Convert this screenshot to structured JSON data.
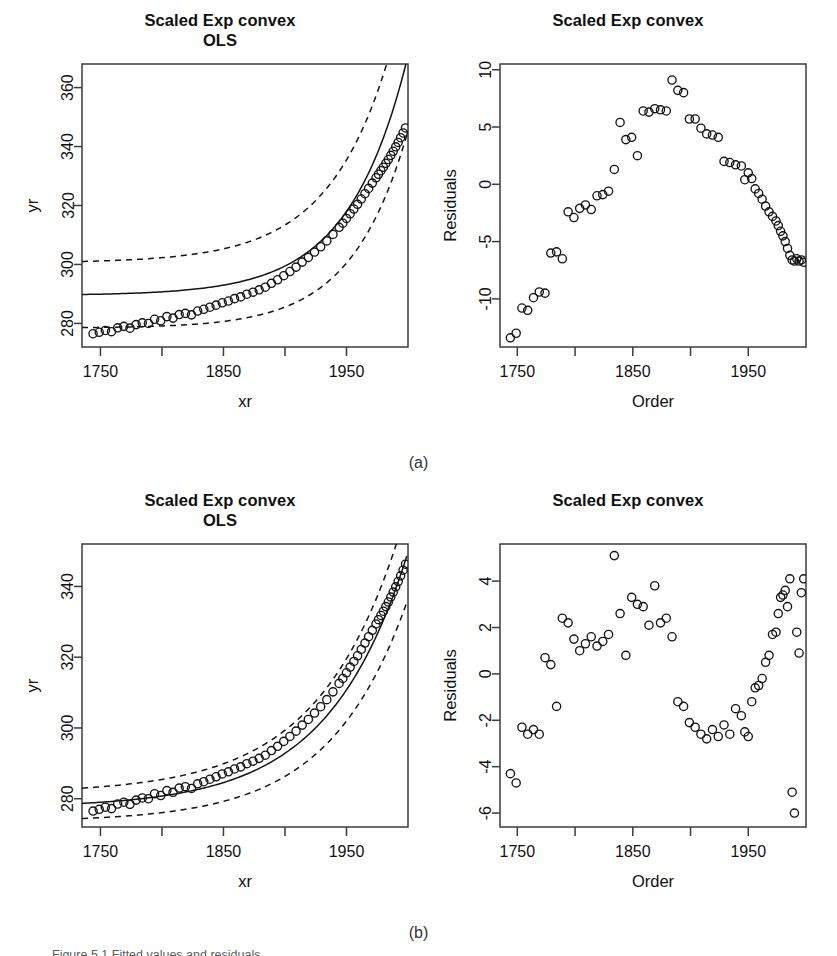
{
  "figure": {
    "panel_a_label": "(a)",
    "panel_b_label": "(b)",
    "caption": "Figure 5.1 Fitted values and residuals"
  },
  "panels": {
    "a_left": {
      "title_line1": "Scaled Exp convex",
      "title_line2": "OLS",
      "xlabel": "xr",
      "ylabel": "yr"
    },
    "a_right": {
      "title_line1": "Scaled Exp convex",
      "title_line2": "",
      "xlabel": "Order",
      "ylabel": "Residuals"
    },
    "b_left": {
      "title_line1": "Scaled Exp convex",
      "title_line2": "OLS",
      "xlabel": "xr",
      "ylabel": "yr"
    },
    "b_right": {
      "title_line1": "Scaled Exp convex",
      "title_line2": "",
      "xlabel": "Order",
      "ylabel": "Residuals"
    }
  },
  "chart_data": [
    {
      "id": "a_left",
      "type": "scatter",
      "title": "Scaled Exp convex OLS",
      "xlabel": "xr",
      "ylabel": "yr",
      "xlim": [
        1735,
        2000
      ],
      "ylim": [
        272,
        368
      ],
      "xticks": [
        1750,
        1800,
        1850,
        1900,
        1950
      ],
      "xticklabels": [
        "1750",
        "",
        "1850",
        "",
        "1950"
      ],
      "yticks": [
        280,
        300,
        320,
        340,
        360
      ],
      "yticklabels": [
        "280",
        "300",
        "320",
        "340",
        "360"
      ],
      "grid": false,
      "legend": "none",
      "x": [
        1744,
        1749,
        1754,
        1759,
        1764,
        1769,
        1774,
        1779,
        1784,
        1789,
        1794,
        1799,
        1804,
        1809,
        1814,
        1819,
        1824,
        1829,
        1834,
        1839,
        1844,
        1849,
        1854,
        1859,
        1864,
        1869,
        1874,
        1879,
        1884,
        1889,
        1894,
        1899,
        1904,
        1909,
        1914,
        1919,
        1924,
        1929,
        1934,
        1939,
        1944,
        1947,
        1950,
        1953,
        1956,
        1959,
        1962,
        1965,
        1968,
        1971,
        1974,
        1976,
        1978,
        1980,
        1982,
        1984,
        1986,
        1988,
        1990,
        1992,
        1994,
        1996,
        1998
      ],
      "y": [
        276.5,
        277.0,
        277.6,
        277.2,
        278.5,
        279.0,
        278.4,
        279.6,
        280.2,
        280.0,
        281.4,
        280.9,
        282.3,
        281.8,
        283.0,
        283.4,
        282.9,
        284.2,
        284.8,
        285.5,
        286.2,
        287.0,
        287.6,
        288.4,
        289.0,
        289.9,
        290.6,
        291.4,
        292.3,
        293.6,
        294.8,
        296.2,
        297.6,
        299.1,
        300.8,
        302.4,
        304.2,
        306.0,
        308.0,
        310.2,
        312.6,
        314.0,
        315.6,
        317.2,
        318.8,
        320.4,
        322.2,
        324.0,
        325.8,
        327.6,
        329.4,
        330.6,
        331.8,
        333.0,
        334.3,
        335.6,
        337.0,
        338.4,
        339.9,
        341.4,
        343.0,
        344.6,
        346.3
      ],
      "fit_curve": {
        "label": "OLS fit",
        "style": "solid"
      },
      "band_curves": {
        "label": "confidence band",
        "style": "dashed",
        "count": 2
      }
    },
    {
      "id": "a_right",
      "type": "scatter",
      "title": "Scaled Exp convex",
      "xlabel": "Order",
      "ylabel": "Residuals",
      "xlim": [
        1735,
        2000
      ],
      "ylim": [
        -14.2,
        10.5
      ],
      "xticks": [
        1750,
        1800,
        1850,
        1900,
        1950
      ],
      "xticklabels": [
        "1750",
        "",
        "1850",
        "",
        "1950"
      ],
      "yticks": [
        -10,
        -5,
        0,
        5,
        10
      ],
      "yticklabels": [
        "-10",
        "-5",
        "0",
        "5",
        "10"
      ],
      "grid": false,
      "legend": "none",
      "x": [
        1744,
        1749,
        1754,
        1759,
        1764,
        1769,
        1774,
        1779,
        1784,
        1789,
        1794,
        1799,
        1804,
        1809,
        1814,
        1819,
        1824,
        1829,
        1834,
        1839,
        1844,
        1849,
        1854,
        1859,
        1864,
        1869,
        1874,
        1879,
        1884,
        1889,
        1894,
        1899,
        1904,
        1909,
        1914,
        1919,
        1924,
        1929,
        1934,
        1939,
        1944,
        1947,
        1950,
        1953,
        1956,
        1959,
        1962,
        1965,
        1968,
        1971,
        1974,
        1976,
        1978,
        1980,
        1982,
        1984,
        1986,
        1988,
        1990,
        1992,
        1994,
        1996,
        1998
      ],
      "y": [
        -13.4,
        -13.0,
        -10.8,
        -11.0,
        -9.9,
        -9.4,
        -9.5,
        -6.0,
        -5.9,
        -6.5,
        -2.4,
        -2.9,
        -2.1,
        -1.8,
        -2.2,
        -1.0,
        -0.9,
        -0.6,
        1.3,
        5.4,
        3.9,
        4.1,
        2.5,
        6.4,
        6.3,
        6.6,
        6.5,
        6.4,
        9.1,
        8.2,
        8.0,
        5.7,
        5.7,
        4.9,
        4.4,
        4.3,
        4.1,
        2.0,
        1.9,
        1.7,
        1.6,
        0.4,
        1.0,
        0.5,
        -0.4,
        -0.8,
        -1.3,
        -1.9,
        -2.4,
        -2.8,
        -3.2,
        -3.6,
        -4.1,
        -4.5,
        -5.0,
        -5.6,
        -6.2,
        -6.6,
        -6.7,
        -6.5,
        -6.7,
        -6.6,
        -6.8
      ]
    },
    {
      "id": "b_left",
      "type": "scatter",
      "title": "Scaled Exp convex OLS",
      "xlabel": "xr",
      "ylabel": "yr",
      "xlim": [
        1735,
        2000
      ],
      "ylim": [
        272,
        352
      ],
      "xticks": [
        1750,
        1800,
        1850,
        1900,
        1950
      ],
      "xticklabels": [
        "1750",
        "",
        "1850",
        "",
        "1950"
      ],
      "yticks": [
        280,
        300,
        320,
        340
      ],
      "yticklabels": [
        "280",
        "300",
        "320",
        "340"
      ],
      "grid": false,
      "legend": "none",
      "x": [
        1744,
        1749,
        1754,
        1759,
        1764,
        1769,
        1774,
        1779,
        1784,
        1789,
        1794,
        1799,
        1804,
        1809,
        1814,
        1819,
        1824,
        1829,
        1834,
        1839,
        1844,
        1849,
        1854,
        1859,
        1864,
        1869,
        1874,
        1879,
        1884,
        1889,
        1894,
        1899,
        1904,
        1909,
        1914,
        1919,
        1924,
        1929,
        1934,
        1939,
        1944,
        1947,
        1950,
        1953,
        1956,
        1959,
        1962,
        1965,
        1968,
        1971,
        1974,
        1976,
        1978,
        1980,
        1982,
        1984,
        1986,
        1988,
        1990,
        1992,
        1994,
        1996,
        1998
      ],
      "y": [
        276.5,
        277.0,
        277.6,
        277.2,
        278.5,
        279.0,
        278.4,
        279.6,
        280.2,
        280.0,
        281.4,
        280.9,
        282.3,
        281.8,
        283.0,
        283.4,
        282.9,
        284.2,
        284.8,
        285.5,
        286.2,
        287.0,
        287.6,
        288.4,
        289.0,
        289.9,
        290.6,
        291.4,
        292.3,
        293.6,
        294.8,
        296.2,
        297.6,
        299.1,
        300.8,
        302.4,
        304.2,
        306.0,
        308.0,
        310.2,
        312.6,
        314.0,
        315.6,
        317.2,
        318.8,
        320.4,
        322.2,
        324.0,
        325.8,
        327.6,
        329.4,
        330.6,
        331.8,
        333.0,
        334.3,
        335.6,
        337.0,
        338.4,
        339.9,
        341.4,
        343.0,
        344.6,
        346.3
      ],
      "fit_curve": {
        "label": "OLS fit",
        "style": "solid"
      },
      "band_curves": {
        "label": "confidence band",
        "style": "dashed",
        "count": 2
      }
    },
    {
      "id": "b_right",
      "type": "scatter",
      "title": "Scaled Exp convex",
      "xlabel": "Order",
      "ylabel": "Residuals",
      "xlim": [
        1735,
        2000
      ],
      "ylim": [
        -6.6,
        5.6
      ],
      "xticks": [
        1750,
        1800,
        1850,
        1900,
        1950
      ],
      "xticklabels": [
        "1750",
        "",
        "1850",
        "",
        "1950"
      ],
      "yticks": [
        -6,
        -4,
        -2,
        0,
        2,
        4
      ],
      "yticklabels": [
        "-6",
        "-4",
        "-2",
        "0",
        "2",
        "4"
      ],
      "grid": false,
      "legend": "none",
      "x": [
        1744,
        1749,
        1754,
        1759,
        1764,
        1769,
        1774,
        1779,
        1784,
        1789,
        1794,
        1799,
        1804,
        1809,
        1814,
        1819,
        1824,
        1829,
        1834,
        1839,
        1844,
        1849,
        1854,
        1859,
        1864,
        1869,
        1874,
        1879,
        1884,
        1889,
        1894,
        1899,
        1904,
        1909,
        1914,
        1919,
        1924,
        1929,
        1934,
        1939,
        1944,
        1947,
        1950,
        1953,
        1956,
        1959,
        1962,
        1965,
        1968,
        1971,
        1974,
        1976,
        1978,
        1980,
        1982,
        1984,
        1986,
        1988,
        1990,
        1992,
        1994,
        1996,
        1998
      ],
      "y": [
        -4.3,
        -4.7,
        -2.3,
        -2.6,
        -2.4,
        -2.6,
        0.7,
        0.4,
        -1.4,
        2.4,
        2.2,
        1.5,
        1.0,
        1.3,
        1.6,
        1.2,
        1.4,
        1.7,
        5.1,
        2.6,
        0.8,
        3.3,
        3.0,
        2.9,
        2.1,
        3.8,
        2.2,
        2.4,
        1.6,
        -1.2,
        -1.4,
        -2.1,
        -2.3,
        -2.6,
        -2.8,
        -2.4,
        -2.7,
        -2.2,
        -2.6,
        -1.5,
        -1.8,
        -2.5,
        -2.7,
        -1.2,
        -0.6,
        -0.5,
        -0.2,
        0.5,
        0.8,
        1.7,
        1.8,
        2.6,
        3.3,
        3.4,
        3.6,
        2.9,
        4.1,
        -5.1,
        -6.0,
        1.8,
        0.9,
        3.5,
        4.1
      ]
    }
  ]
}
